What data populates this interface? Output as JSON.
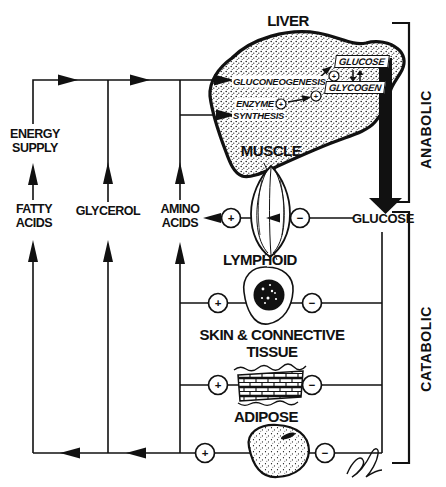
{
  "colors": {
    "ink": "#111111",
    "paper": "#ffffff"
  },
  "symbols": {
    "plus": "+",
    "minus": "−"
  },
  "organs": {
    "liver": {
      "label": "LIVER",
      "processes": {
        "gluconeogenesis": "GLUCONEOGENESIS",
        "enzyme": "ENZYME",
        "synthesis": "SYNTHESIS"
      },
      "stores": {
        "glucose": "GLUCOSE",
        "glycogen": "GLYCOGEN"
      }
    },
    "muscle": {
      "label": "MUSCLE"
    },
    "lymphoid": {
      "label": "LYMPHOID"
    },
    "skin": {
      "line1": "SKIN & CONNECTIVE",
      "line2": "TISSUE"
    },
    "adipose": {
      "label": "ADIPOSE"
    }
  },
  "metabolites": {
    "energy": {
      "line1": "ENERGY",
      "line2": "SUPPLY"
    },
    "fatty": {
      "line1": "FATTY",
      "line2": "ACIDS"
    },
    "glycerol": {
      "label": "GLYCEROL"
    },
    "amino": {
      "line1": "AMINO",
      "line2": "ACIDS"
    },
    "glucose": {
      "label": "GLUCOSE"
    }
  },
  "brackets": {
    "anabolic": "ANABOLIC",
    "catabolic": "CATABOLIC"
  }
}
